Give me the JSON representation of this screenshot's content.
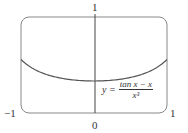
{
  "chart_data": {
    "type": "line",
    "title": "",
    "xlabel": "",
    "ylabel": "",
    "xlim": [
      -1,
      1
    ],
    "ylim": [
      0,
      1
    ],
    "grid": false,
    "x_tick_labels": [
      "-1",
      "0",
      "1"
    ],
    "y_tick_labels": [
      "1"
    ],
    "annotation": "y = (tan x − x) / x^3",
    "series": [
      {
        "name": "y = (tan x - x)/x^3",
        "x": [
          -1,
          -0.75,
          -0.5,
          -0.25,
          0,
          0.25,
          0.5,
          0.75,
          1
        ],
        "y": [
          0.557,
          0.427,
          0.37,
          0.342,
          0.333,
          0.342,
          0.37,
          0.427,
          0.557
        ]
      }
    ],
    "colors": {
      "curve": "#555555",
      "frame": "#777777",
      "axis": "#444444"
    }
  },
  "labels": {
    "y_top": "1",
    "x_left": "−1",
    "x_origin": "0",
    "x_right": "1",
    "formula_lhs": "y =",
    "formula_num": "tan x − x",
    "formula_den": "x³"
  }
}
